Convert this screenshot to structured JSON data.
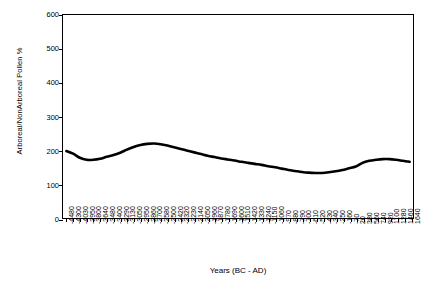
{
  "chart_data": {
    "type": "line",
    "title": "",
    "xlabel": "Years (BC - AD)",
    "ylabel": "Arboreal/NonArboreal Pollen %",
    "ylim": [
      0,
      600
    ],
    "yticks": [
      0,
      100,
      200,
      300,
      400,
      500,
      600
    ],
    "grid": false,
    "legend": null,
    "categories": [
      "-4480",
      "-4300",
      "-4030",
      "-3950",
      "-3800",
      "-3640",
      "-3480",
      "-3400",
      "-3290",
      "-3130",
      "-3050",
      "-2950",
      "-2860",
      "-2700",
      "-2580",
      "-2500",
      "-2420",
      "-2320",
      "-2230",
      "-2140",
      "-2050",
      "-1960",
      "-1870",
      "-1780",
      "-1690",
      "-1600",
      "-1510",
      "-1420",
      "-1330",
      "-1240",
      "-1150",
      "-1060",
      "-970",
      "-880",
      "-790",
      "-700",
      "-610",
      "-520",
      "-430",
      "-340",
      "-250",
      "-160",
      "-70",
      "20",
      "380",
      "560",
      "740",
      "920",
      "1100",
      "1280",
      "1460",
      "1640"
    ],
    "series": [
      {
        "name": "Arboreal/NonArboreal Pollen %",
        "values": [
          198,
          190,
          178,
          172,
          172,
          175,
          181,
          186,
          193,
          202,
          210,
          216,
          219,
          220,
          218,
          214,
          209,
          204,
          199,
          194,
          189,
          184,
          180,
          176,
          173,
          170,
          166,
          163,
          160,
          157,
          153,
          150,
          146,
          142,
          139,
          136,
          134,
          133,
          133,
          135,
          138,
          142,
          147,
          152,
          163,
          169,
          172,
          174,
          174,
          172,
          169,
          166
        ]
      }
    ]
  }
}
